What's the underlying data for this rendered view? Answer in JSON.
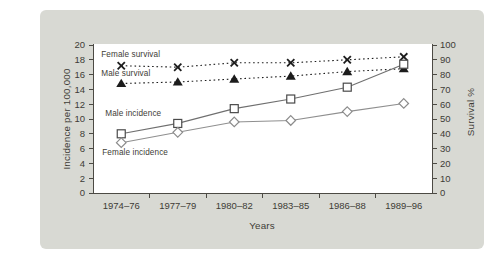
{
  "panel": {
    "background": "#d8d9d3"
  },
  "chart_data": {
    "type": "line",
    "title": "",
    "categories": [
      "1974–76",
      "1977–79",
      "1980–82",
      "1983–85",
      "1986–88",
      "1989–96"
    ],
    "xlabel": "Years",
    "left_axis": {
      "label": "Incidence per 100,000",
      "min": 0,
      "max": 20,
      "ticks": [
        0,
        2,
        4,
        6,
        8,
        10,
        12,
        14,
        16,
        18,
        20
      ]
    },
    "right_axis": {
      "label": "Survival %",
      "min": 0,
      "max": 100,
      "ticks": [
        0,
        10,
        20,
        30,
        40,
        50,
        60,
        70,
        80,
        90,
        100
      ]
    },
    "grid": false,
    "legend": "inline-labels",
    "axis_color": "#4c4a44",
    "text_color": "#3e3c36",
    "plot_background": "#ffffff",
    "series": [
      {
        "name": "Female survival",
        "axis": "right",
        "marker": "x",
        "line": "dotted",
        "color": "#1c1c1c",
        "marker_color": "#1c1c1c",
        "values": [
          86,
          85,
          88,
          88,
          90,
          92
        ]
      },
      {
        "name": "Male survival",
        "axis": "right",
        "marker": "triangle",
        "line": "dotted",
        "color": "#1c1c1c",
        "marker_color": "#1c1c1c",
        "values": [
          74,
          75,
          77,
          79,
          82,
          84
        ]
      },
      {
        "name": "Male incidence",
        "axis": "left",
        "marker": "square",
        "line": "solid",
        "color": "#6f6f6f",
        "marker_color": "#4a4a4a",
        "values": [
          8.0,
          9.4,
          11.4,
          12.7,
          14.3,
          17.4
        ]
      },
      {
        "name": "Female incidence",
        "axis": "left",
        "marker": "diamond",
        "line": "solid",
        "color": "#8f8f8f",
        "marker_color": "#8c8c8c",
        "values": [
          6.8,
          8.2,
          9.6,
          9.8,
          11.0,
          12.1
        ]
      }
    ]
  }
}
